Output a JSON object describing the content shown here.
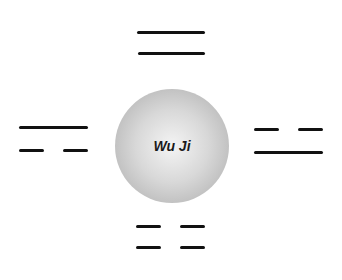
{
  "diagram": {
    "center": {
      "label": "Wu Ji",
      "shape": "circle",
      "fill": "radial gray gradient"
    },
    "digrams": [
      {
        "position": "top",
        "lines": [
          "yang",
          "yang"
        ],
        "name": "old-yang"
      },
      {
        "position": "left",
        "lines": [
          "yang",
          "yin"
        ],
        "name": "young-yin"
      },
      {
        "position": "right",
        "lines": [
          "yin",
          "yang"
        ],
        "name": "young-yang"
      },
      {
        "position": "bottom",
        "lines": [
          "yin",
          "yin"
        ],
        "name": "old-yin"
      }
    ],
    "colors": {
      "line": "#111111",
      "background": "#ffffff"
    }
  }
}
